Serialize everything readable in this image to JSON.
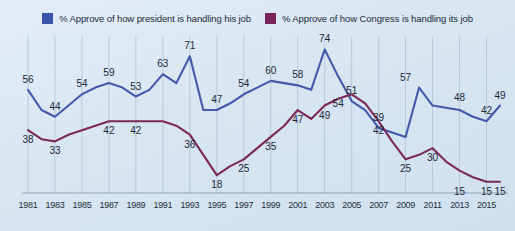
{
  "legend": {
    "items": [
      {
        "label": "% Approve of how president is handling his job",
        "color": "#3b53a8",
        "icon": "blue-square-icon"
      },
      {
        "label": "% Approve of how Congress is handling its job",
        "color": "#78265a",
        "icon": "purple-square-icon"
      }
    ]
  },
  "colors": {
    "background": "#dae7f3",
    "president_line": "#4459ab",
    "congress_line": "#7b2a55",
    "gridline": "#a9bdd2",
    "axis": "#8fa6bd",
    "text": "#1b2634"
  },
  "chart_data": {
    "type": "line",
    "title": "",
    "subtitle": "",
    "xlabel": "",
    "ylabel": "",
    "ylim": [
      10,
      80
    ],
    "xlim": [
      1981,
      2016
    ],
    "grid": true,
    "legend_position": "top-center",
    "tick_labels": [
      "1981",
      "1983",
      "1985",
      "1987",
      "1989",
      "1991",
      "1993",
      "1995",
      "1997",
      "1999",
      "2001",
      "2003",
      "2005",
      "2007",
      "2009",
      "2011",
      "2013",
      "2015"
    ],
    "x": [
      1981,
      1982,
      1983,
      1984,
      1985,
      1986,
      1987,
      1988,
      1989,
      1990,
      1991,
      1992,
      1993,
      1994,
      1995,
      1996,
      1997,
      1998,
      1999,
      2000,
      2001,
      2002,
      2003,
      2004,
      2005,
      2006,
      2007,
      2008,
      2009,
      2010,
      2011,
      2012,
      2013,
      2014,
      2015,
      2016
    ],
    "series": [
      {
        "name": "% Approve of how president is handling his job",
        "color": "#4459ab",
        "values": [
          56,
          47,
          44,
          49,
          54,
          57,
          59,
          57,
          53,
          56,
          63,
          59,
          71,
          47,
          47,
          50,
          54,
          57,
          60,
          59,
          58,
          56,
          74,
          62,
          51,
          47,
          39,
          37,
          35,
          57,
          49,
          48,
          47,
          44,
          42,
          49
        ],
        "labeled_points": [
          {
            "year": 1981,
            "value": 56
          },
          {
            "year": 1983,
            "value": 44
          },
          {
            "year": 1985,
            "value": 54
          },
          {
            "year": 1987,
            "value": 59
          },
          {
            "year": 1989,
            "value": 53
          },
          {
            "year": 1991,
            "value": 63
          },
          {
            "year": 1993,
            "value": 71
          },
          {
            "year": 1995,
            "value": 47
          },
          {
            "year": 1997,
            "value": 54
          },
          {
            "year": 1999,
            "value": 60
          },
          {
            "year": 2001,
            "value": 58
          },
          {
            "year": 2003,
            "value": 74
          },
          {
            "year": 2005,
            "value": 51
          },
          {
            "year": 2007,
            "value": 39
          },
          {
            "year": 2009,
            "value": 57
          },
          {
            "year": 2013,
            "value": 48
          },
          {
            "year": 2015,
            "value": 42
          },
          {
            "year": 2016,
            "value": 49
          }
        ]
      },
      {
        "name": "% Approve of how Congress is handling its job",
        "color": "#7b2a55",
        "values": [
          38,
          34,
          33,
          36,
          38,
          40,
          42,
          42,
          42,
          42,
          42,
          40,
          36,
          27,
          18,
          22,
          25,
          30,
          35,
          40,
          47,
          43,
          49,
          52,
          54,
          50,
          42,
          33,
          25,
          27,
          30,
          24,
          20,
          17,
          15,
          15
        ],
        "labeled_points": [
          {
            "year": 1981,
            "value": 38
          },
          {
            "year": 1983,
            "value": 33
          },
          {
            "year": 1987,
            "value": 42
          },
          {
            "year": 1989,
            "value": 42
          },
          {
            "year": 1993,
            "value": 36
          },
          {
            "year": 1995,
            "value": 18
          },
          {
            "year": 1997,
            "value": 25
          },
          {
            "year": 1999,
            "value": 35
          },
          {
            "year": 2001,
            "value": 47
          },
          {
            "year": 2003,
            "value": 49
          },
          {
            "year": 2004,
            "value": 54
          },
          {
            "year": 2007,
            "value": 42
          },
          {
            "year": 2009,
            "value": 25
          },
          {
            "year": 2011,
            "value": 30
          },
          {
            "year": 2013,
            "value": 15
          },
          {
            "year": 2015,
            "value": 15
          },
          {
            "year": 2016,
            "value": 15
          }
        ]
      }
    ]
  }
}
